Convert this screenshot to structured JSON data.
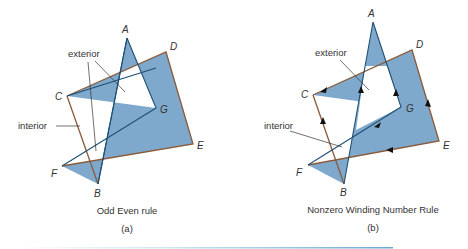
{
  "colors": {
    "fill": "#7fa9cc",
    "edge_outer": "#8a5a3a",
    "edge_inner": "#1e4f73",
    "leader": "#333333",
    "rule_line": "#6aa9cf"
  },
  "panels": [
    {
      "id": "a",
      "caption": "Odd Even rule",
      "sublabel": "(a)",
      "vertices": {
        "A": "A",
        "B": "B",
        "C": "C",
        "D": "D",
        "E": "E",
        "F": "F",
        "G": "G"
      },
      "labels": {
        "exterior": "exterior",
        "interior": "interior"
      }
    },
    {
      "id": "b",
      "caption": "Nonzero Winding Number Rule",
      "sublabel": "(b)",
      "vertices": {
        "A": "A",
        "B": "B",
        "C": "C",
        "D": "D",
        "E": "E",
        "F": "F",
        "G": "G"
      },
      "labels": {
        "exterior": "exterior",
        "interior": "interior"
      }
    }
  ]
}
